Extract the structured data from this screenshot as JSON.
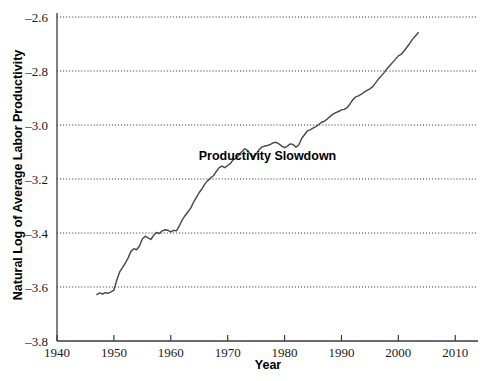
{
  "chart_data": {
    "type": "line",
    "title": "",
    "xlabel": "Year",
    "ylabel": "Natural Log of Average Labor Productivity",
    "xlim": [
      1940,
      2014
    ],
    "ylim": [
      -3.8,
      -2.6
    ],
    "grid": true,
    "legend": "none",
    "xticks": [
      1940,
      1950,
      1960,
      1970,
      1980,
      1990,
      2000,
      2010
    ],
    "xticklabels": [
      "1940",
      "1950",
      "1960",
      "1970",
      "1980",
      "1990",
      "2000",
      "2010"
    ],
    "yticks": [
      -2.6,
      -2.8,
      -3.0,
      -3.2,
      -3.4,
      -3.6,
      -3.8
    ],
    "yticklabels": [
      "-2.6",
      "-2.8",
      "-3.0",
      "-3.2",
      "-3.4",
      "-3.6",
      "-3.8"
    ],
    "annotations": [
      {
        "text": "Productivity Slowdown",
        "x": 1977.0,
        "y": -3.128
      }
    ],
    "series": [
      {
        "name": "Natural Log of Average Labor Productivity",
        "color": "#4a4a4a",
        "x": [
          1947.0,
          1947.5,
          1948.0,
          1948.5,
          1949.0,
          1949.5,
          1950.0,
          1950.5,
          1951.0,
          1951.5,
          1952.0,
          1952.5,
          1953.0,
          1953.5,
          1954.0,
          1954.5,
          1955.0,
          1955.5,
          1956.0,
          1956.5,
          1957.0,
          1957.5,
          1958.0,
          1958.5,
          1959.0,
          1959.5,
          1960.0,
          1960.5,
          1961.0,
          1961.5,
          1962.0,
          1962.5,
          1963.0,
          1963.5,
          1964.0,
          1964.5,
          1965.0,
          1965.5,
          1966.0,
          1966.5,
          1967.0,
          1967.5,
          1968.0,
          1968.5,
          1969.0,
          1969.5,
          1970.0,
          1970.5,
          1971.0,
          1971.5,
          1972.0,
          1972.5,
          1973.0,
          1973.5,
          1974.0,
          1974.5,
          1975.0,
          1975.5,
          1976.0,
          1976.5,
          1977.0,
          1977.5,
          1978.0,
          1978.5,
          1979.0,
          1979.5,
          1980.0,
          1980.5,
          1981.0,
          1981.5,
          1982.0,
          1982.5,
          1983.0,
          1983.5,
          1984.0,
          1984.5,
          1985.0,
          1985.5,
          1986.0,
          1986.5,
          1987.0,
          1987.5,
          1988.0,
          1988.5,
          1989.0,
          1989.5,
          1990.0,
          1990.5,
          1991.0,
          1991.5,
          1992.0,
          1992.5,
          1993.0,
          1993.5,
          1994.0,
          1994.5,
          1995.0,
          1995.5,
          1996.0,
          1996.5,
          1997.0,
          1997.5,
          1998.0,
          1998.5,
          1999.0,
          1999.5,
          2000.0,
          2000.5,
          2001.0,
          2001.5,
          2002.0,
          2002.5,
          2003.0,
          2003.5
        ],
        "y": [
          -3.628,
          -3.622,
          -3.626,
          -3.621,
          -3.623,
          -3.618,
          -3.612,
          -3.575,
          -3.545,
          -3.528,
          -3.512,
          -3.492,
          -3.468,
          -3.458,
          -3.462,
          -3.448,
          -3.422,
          -3.412,
          -3.418,
          -3.424,
          -3.408,
          -3.398,
          -3.402,
          -3.392,
          -3.388,
          -3.39,
          -3.396,
          -3.39,
          -3.392,
          -3.374,
          -3.352,
          -3.336,
          -3.322,
          -3.308,
          -3.286,
          -3.268,
          -3.25,
          -3.236,
          -3.218,
          -3.206,
          -3.196,
          -3.188,
          -3.172,
          -3.158,
          -3.152,
          -3.158,
          -3.15,
          -3.142,
          -3.128,
          -3.124,
          -3.11,
          -3.098,
          -3.088,
          -3.094,
          -3.108,
          -3.118,
          -3.108,
          -3.092,
          -3.082,
          -3.078,
          -3.076,
          -3.072,
          -3.066,
          -3.064,
          -3.07,
          -3.078,
          -3.084,
          -3.078,
          -3.07,
          -3.072,
          -3.082,
          -3.074,
          -3.05,
          -3.036,
          -3.022,
          -3.018,
          -3.012,
          -3.006,
          -2.998,
          -2.99,
          -2.986,
          -2.978,
          -2.968,
          -2.96,
          -2.954,
          -2.95,
          -2.944,
          -2.942,
          -2.936,
          -2.922,
          -2.906,
          -2.896,
          -2.892,
          -2.886,
          -2.878,
          -2.872,
          -2.866,
          -2.858,
          -2.844,
          -2.83,
          -2.818,
          -2.806,
          -2.792,
          -2.78,
          -2.768,
          -2.756,
          -2.744,
          -2.738,
          -2.726,
          -2.712,
          -2.698,
          -2.682,
          -2.67,
          -2.658
        ]
      }
    ]
  }
}
